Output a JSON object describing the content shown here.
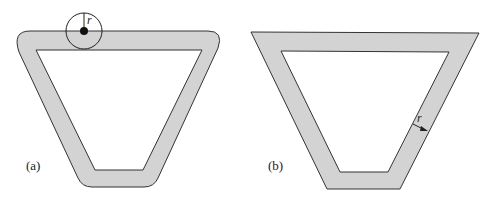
{
  "figure": {
    "panels": [
      {
        "id": "a",
        "label": "(a)",
        "radius_label": "r",
        "description": "Trapezoidal band with rounded outer corners traced by a disc of radius r"
      },
      {
        "id": "b",
        "label": "(b)",
        "radius_label": "r",
        "description": "Trapezoidal band with sharp corners, offset by distance r"
      }
    ],
    "colors": {
      "band_fill": "#d3d3d3",
      "stroke": "#333333",
      "background": "#ffffff"
    }
  }
}
